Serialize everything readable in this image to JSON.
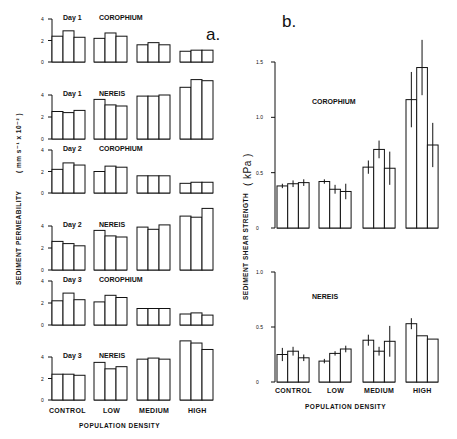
{
  "chart_data": [
    {
      "panel": "a.",
      "type": "bar",
      "ylabel": "SEDIMENT PERMEABILITY ( mm s-1 x 10-2 )",
      "xlabel": "POPULATION DENSITY",
      "categories": [
        "CONTROL",
        "LOW",
        "MEDIUM",
        "HIGH"
      ],
      "yticks": [
        0,
        2,
        4
      ],
      "ylim": [
        0,
        4
      ],
      "subplots": [
        {
          "title_day": "Day 1",
          "title_species": "COROPHIUM",
          "values": [
            [
              2.4,
              2.9,
              2.3
            ],
            [
              2.2,
              2.7,
              2.4
            ],
            [
              1.6,
              1.8,
              1.6
            ],
            [
              1.0,
              1.1,
              1.1
            ]
          ]
        },
        {
          "title_day": "Day 1",
          "title_species": "NEREIS",
          "values": [
            [
              2.5,
              2.4,
              2.6
            ],
            [
              3.6,
              3.1,
              3.0
            ],
            [
              3.9,
              3.9,
              4.0
            ],
            [
              4.7,
              5.4,
              5.3
            ]
          ]
        },
        {
          "title_day": "Day 2",
          "title_species": "COROPHIUM",
          "values": [
            [
              2.2,
              2.8,
              2.6
            ],
            [
              2.0,
              2.5,
              2.4
            ],
            [
              1.6,
              1.6,
              1.6
            ],
            [
              0.9,
              1.0,
              1.0
            ]
          ]
        },
        {
          "title_day": "Day 2",
          "title_species": "NEREIS",
          "values": [
            [
              2.6,
              2.4,
              2.2
            ],
            [
              3.6,
              3.1,
              3.0
            ],
            [
              3.9,
              3.7,
              4.1
            ],
            [
              4.9,
              4.8,
              5.6
            ]
          ]
        },
        {
          "title_day": "Day 3",
          "title_species": "COROPHIUM",
          "values": [
            [
              2.2,
              2.9,
              2.3
            ],
            [
              2.1,
              2.7,
              2.5
            ],
            [
              1.5,
              1.5,
              1.5
            ],
            [
              1.0,
              1.1,
              0.9
            ]
          ]
        },
        {
          "title_day": "Day 3",
          "title_species": "NEREIS",
          "values": [
            [
              2.4,
              2.4,
              2.3
            ],
            [
              3.5,
              2.9,
              3.1
            ],
            [
              3.8,
              3.9,
              3.8
            ],
            [
              5.5,
              5.3,
              4.7
            ]
          ]
        }
      ]
    },
    {
      "panel": "b.",
      "type": "bar",
      "ylabel": "SEDIMENT SHEAR STRENGTH ( kPa )",
      "xlabel": "POPULATION DENSITY",
      "categories": [
        "CONTROL",
        "LOW",
        "MEDIUM",
        "HIGH"
      ],
      "subplots": [
        {
          "title_species": "COROPHIUM",
          "yticks": [
            0,
            0.5,
            1.0,
            1.5
          ],
          "ylim": [
            0,
            1.5
          ],
          "values": [
            [
              0.38,
              0.4,
              0.41
            ],
            [
              0.42,
              0.35,
              0.33
            ],
            [
              0.55,
              0.71,
              0.54
            ],
            [
              1.16,
              1.45,
              0.75
            ]
          ],
          "errors": [
            [
              0.02,
              0.03,
              0.03
            ],
            [
              0.02,
              0.04,
              0.07
            ],
            [
              0.06,
              0.08,
              0.15
            ],
            [
              0.25,
              0.25,
              0.2
            ]
          ]
        },
        {
          "title_species": "NEREIS",
          "yticks": [
            0,
            0.5,
            1.0
          ],
          "ylim": [
            0,
            1.0
          ],
          "values": [
            [
              0.25,
              0.28,
              0.22
            ],
            [
              0.19,
              0.26,
              0.3
            ],
            [
              0.38,
              0.28,
              0.37
            ],
            [
              0.53,
              0.42,
              0.39
            ]
          ],
          "errors": [
            [
              0.06,
              0.04,
              0.03
            ],
            [
              0.02,
              0.02,
              0.03
            ],
            [
              0.05,
              0.04,
              0.14
            ],
            [
              0.05,
              0.0,
              0.0
            ]
          ]
        }
      ]
    }
  ],
  "labels": {
    "panel_a": "a.",
    "panel_b": "b.",
    "ylabel_a": "SEDIMENT PERMEABILITY",
    "ylabel_a_units": "( mm s⁻¹ x 10⁻² )",
    "ylabel_b": "SEDIMENT SHEAR STRENGTH",
    "ylabel_b_units": "( kPa )",
    "xlabel": "POPULATION DENSITY",
    "cat_control": "CONTROL",
    "cat_low": "LOW",
    "cat_medium": "MEDIUM",
    "cat_high": "HIGH",
    "corophium": "COROPHIUM",
    "nereis": "NEREIS",
    "day1": "Day 1",
    "day2": "Day 2",
    "day3": "Day 3",
    "t0": "0",
    "t2": "2",
    "t4": "4",
    "b0": "0",
    "b05": "0.5",
    "b10": "1.0",
    "b15": "1.5"
  }
}
